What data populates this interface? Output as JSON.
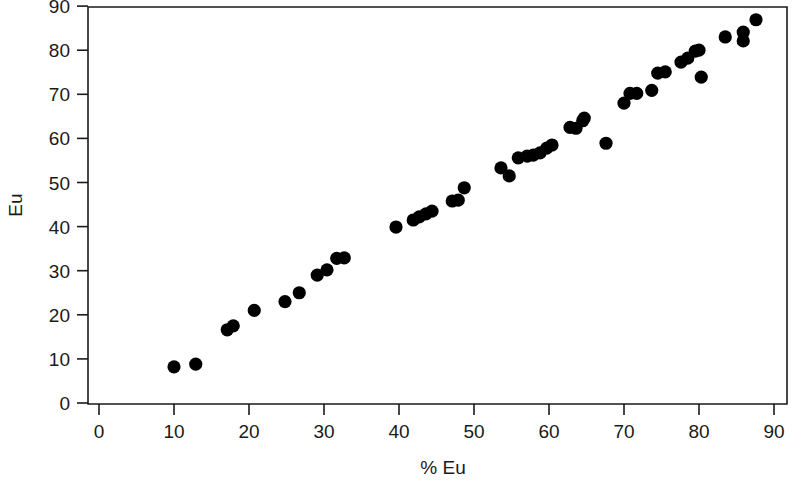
{
  "chart_data": {
    "type": "scatter",
    "title": "",
    "xlabel": "% Eu",
    "ylabel": "Eu",
    "xlim": [
      0,
      90
    ],
    "ylim": [
      0,
      90
    ],
    "xticks": [
      0,
      10,
      20,
      30,
      40,
      50,
      60,
      70,
      80,
      90
    ],
    "yticks": [
      0,
      10,
      20,
      30,
      40,
      50,
      60,
      70,
      80,
      90
    ],
    "grid": false,
    "legend": null,
    "marker": "filled-circle",
    "marker_color": "#000000",
    "marker_size": 7,
    "series": [
      {
        "name": "Eu measurements",
        "points": [
          [
            10.0,
            8.2
          ],
          [
            12.9,
            8.8
          ],
          [
            17.1,
            16.6
          ],
          [
            17.9,
            17.5
          ],
          [
            20.7,
            21.0
          ],
          [
            24.8,
            23.0
          ],
          [
            26.7,
            25.0
          ],
          [
            29.1,
            29.0
          ],
          [
            30.4,
            30.2
          ],
          [
            31.7,
            32.8
          ],
          [
            32.7,
            32.9
          ],
          [
            39.6,
            39.9
          ],
          [
            41.9,
            41.5
          ],
          [
            42.7,
            42.2
          ],
          [
            43.6,
            42.9
          ],
          [
            44.4,
            43.5
          ],
          [
            47.1,
            45.8
          ],
          [
            47.9,
            46.0
          ],
          [
            48.7,
            48.8
          ],
          [
            53.6,
            53.3
          ],
          [
            54.7,
            51.5
          ],
          [
            55.9,
            55.6
          ],
          [
            57.1,
            56.0
          ],
          [
            57.9,
            56.2
          ],
          [
            58.8,
            56.7
          ],
          [
            59.7,
            57.8
          ],
          [
            60.4,
            58.5
          ],
          [
            62.8,
            62.5
          ],
          [
            63.6,
            62.3
          ],
          [
            64.5,
            64.0
          ],
          [
            64.7,
            64.6
          ],
          [
            67.6,
            58.9
          ],
          [
            70.0,
            68.0
          ],
          [
            70.8,
            70.2
          ],
          [
            71.7,
            70.2
          ],
          [
            73.7,
            70.9
          ],
          [
            74.5,
            74.8
          ],
          [
            75.5,
            75.1
          ],
          [
            77.6,
            77.3
          ],
          [
            78.5,
            78.2
          ],
          [
            79.5,
            79.8
          ],
          [
            80.0,
            80.0
          ],
          [
            80.3,
            73.9
          ],
          [
            83.5,
            83.0
          ],
          [
            85.9,
            84.1
          ],
          [
            85.9,
            82.1
          ],
          [
            87.6,
            86.9
          ]
        ]
      }
    ]
  },
  "geometry": {
    "plot_left": 88,
    "plot_right": 787,
    "plot_top": 7,
    "plot_bottom": 404,
    "x_zero_px": 99,
    "x_unit_px": 7.5,
    "y_zero_px": 403,
    "y_unit_px": 4.41
  }
}
